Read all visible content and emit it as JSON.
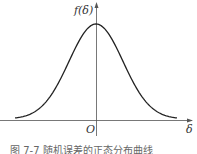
{
  "chart_data": {
    "type": "line",
    "title": "",
    "xlabel": "δ",
    "ylabel": "f(δ)",
    "origin_label": "O",
    "x": [
      -3,
      -2.5,
      -2,
      -1.5,
      -1,
      -0.5,
      0,
      0.5,
      1,
      1.5,
      2,
      2.5,
      3
    ],
    "series": [
      {
        "name": "f(δ)",
        "values": [
          0.011,
          0.044,
          0.135,
          0.325,
          0.607,
          0.882,
          1.0,
          0.882,
          0.607,
          0.325,
          0.135,
          0.044,
          0.011
        ]
      }
    ],
    "grid": false,
    "legend": "none"
  },
  "labels": {
    "y_axis": "f(δ)",
    "x_axis": "δ",
    "origin": "O"
  },
  "caption": "图 7-7   随机误差的正态分布曲线",
  "colors": {
    "curve": "#222222",
    "axis": "#555555"
  }
}
